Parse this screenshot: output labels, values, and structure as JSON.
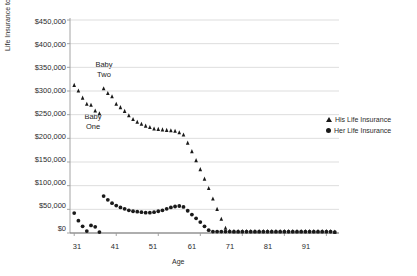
{
  "chart_data": {
    "type": "scatter",
    "title": "",
    "xlabel": "Age",
    "ylabel": "Life Insurance to Buy",
    "xlim": [
      30,
      94
    ],
    "ylim": [
      0,
      450000
    ],
    "grid": true,
    "legend_position": "right",
    "y_ticks": [
      "$0",
      "$50,000",
      "$100,000",
      "$150,000",
      "$200,000",
      "$250,000",
      "$300,000",
      "$350,000",
      "$400,000",
      "$450,000"
    ],
    "y_tick_values": [
      0,
      50000,
      100000,
      150000,
      200000,
      250000,
      300000,
      350000,
      400000,
      450000
    ],
    "x_ticks": [
      "31",
      "41",
      "51",
      "61",
      "71",
      "81",
      "91"
    ],
    "x_tick_values": [
      31,
      41,
      51,
      61,
      71,
      81,
      91
    ],
    "annotations": [
      {
        "text": "Baby\nTwo",
        "line1": "Baby",
        "line2": "Two",
        "x": 41,
        "y": 345000
      },
      {
        "text": "Baby\nOne",
        "line1": "Baby",
        "line2": "One",
        "x": 34,
        "y": 232000
      }
    ],
    "series": [
      {
        "name": "His Life Insurance",
        "marker": "triangle",
        "color": "#1a1a1a",
        "x": [
          31,
          32,
          33,
          34,
          35,
          36,
          37,
          38,
          39,
          40,
          41,
          42,
          43,
          44,
          45,
          46,
          47,
          48,
          49,
          50,
          51,
          52,
          53,
          54,
          55,
          56,
          57,
          58,
          59,
          60,
          61,
          62,
          63,
          64,
          65,
          66,
          67,
          68,
          69,
          70,
          71,
          72,
          73,
          74,
          75,
          76,
          77,
          78,
          79,
          80,
          81,
          82,
          83,
          84,
          85,
          86,
          87,
          88,
          89,
          90,
          91,
          92,
          93
        ],
        "y": [
          312000,
          300000,
          285000,
          272000,
          270000,
          258000,
          252000,
          305000,
          295000,
          288000,
          272000,
          265000,
          257000,
          248000,
          240000,
          234000,
          230000,
          226000,
          223000,
          220000,
          219000,
          218000,
          217000,
          216000,
          215000,
          212000,
          207000,
          190000,
          172000,
          153000,
          134000,
          114000,
          94000,
          72000,
          50000,
          29000,
          10000,
          4000,
          3000,
          3000,
          3000,
          3000,
          3000,
          3000,
          3000,
          3000,
          3000,
          3000,
          3000,
          3000,
          3000,
          3000,
          3000,
          3000,
          3000,
          3000,
          3000,
          3000,
          3000,
          3000,
          3000,
          3000,
          2000
        ]
      },
      {
        "name": "Her Life Insurance",
        "marker": "circle",
        "color": "#1a1a1a",
        "x": [
          31,
          32,
          33,
          34,
          35,
          36,
          37,
          38,
          39,
          40,
          41,
          42,
          43,
          44,
          45,
          46,
          47,
          48,
          49,
          50,
          51,
          52,
          53,
          54,
          55,
          56,
          57,
          58,
          59,
          60,
          61,
          62,
          63,
          64,
          65,
          66,
          67,
          68,
          69,
          70,
          71,
          72,
          73,
          74,
          75,
          76,
          77,
          78,
          79,
          80,
          81,
          82,
          83,
          84,
          85,
          86,
          87,
          88,
          89,
          90,
          91,
          92,
          93
        ],
        "y": [
          42000,
          26000,
          14000,
          4000,
          16000,
          13000,
          2000,
          78000,
          70000,
          63000,
          58000,
          54000,
          51000,
          48000,
          46000,
          45000,
          44000,
          43000,
          43000,
          44000,
          46000,
          48000,
          51000,
          54000,
          56000,
          57000,
          55000,
          47000,
          39000,
          31000,
          23000,
          14000,
          6000,
          3000,
          3000,
          3000,
          3000,
          3000,
          3000,
          3000,
          3000,
          3000,
          3000,
          3000,
          3000,
          3000,
          3000,
          3000,
          3000,
          3000,
          3000,
          3000,
          3000,
          3000,
          3000,
          3000,
          3000,
          3000,
          3000,
          3000,
          3000,
          3000,
          2000
        ]
      }
    ]
  },
  "legend": {
    "items": [
      {
        "label": "His Life Insurance",
        "marker": "triangle"
      },
      {
        "label": "Her Life Insurance",
        "marker": "circle"
      }
    ]
  }
}
